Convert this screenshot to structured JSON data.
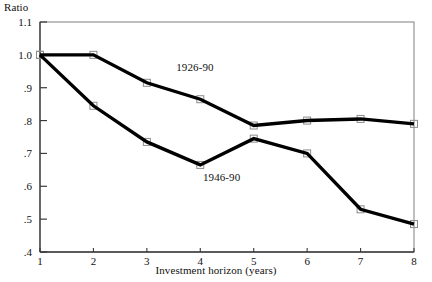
{
  "chart_data": {
    "type": "line",
    "title": "",
    "xlabel": "Investment horizon (years)",
    "ylabel": "Ratio",
    "x": [
      1,
      2,
      3,
      4,
      5,
      6,
      7,
      8
    ],
    "xlim": [
      1,
      8
    ],
    "ylim": [
      0.4,
      1.1
    ],
    "xticks": [
      "1",
      "2",
      "3",
      "4",
      "5",
      "6",
      "7",
      "8"
    ],
    "yticks": [
      ".4",
      ".5",
      ".6",
      ".7",
      ".8",
      ".9",
      "1.0",
      "1.1"
    ],
    "ytick_values": [
      0.4,
      0.5,
      0.6,
      0.7,
      0.8,
      0.9,
      1.0,
      1.1
    ],
    "grid": false,
    "legend_position": "inline-annotations",
    "series": [
      {
        "name": "1926-90",
        "values": [
          1.0,
          1.0,
          0.915,
          0.865,
          0.785,
          0.8,
          0.805,
          0.79
        ],
        "color": "#000000",
        "label_x": 3.55,
        "label_y": 0.96
      },
      {
        "name": "1946-90",
        "values": [
          1.0,
          0.845,
          0.735,
          0.665,
          0.745,
          0.7,
          0.53,
          0.485
        ],
        "color": "#000000",
        "label_x": 4.05,
        "label_y": 0.625
      }
    ],
    "annotations": [
      {
        "text": "1926-90",
        "x": 3.55,
        "y": 0.96
      },
      {
        "text": "1946-90",
        "x": 4.05,
        "y": 0.625
      }
    ]
  },
  "axes": {
    "y_title": "Ratio",
    "x_title": "Investment horizon (years)"
  }
}
